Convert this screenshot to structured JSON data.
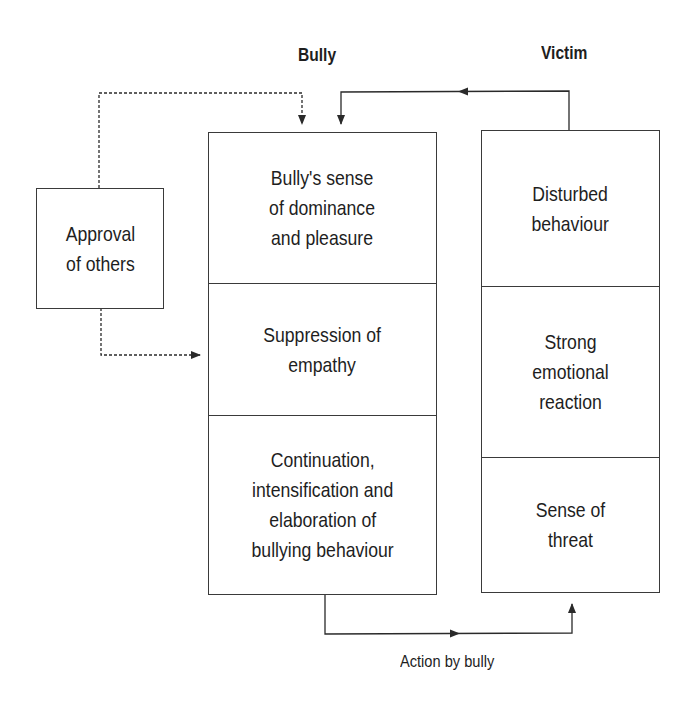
{
  "headings": {
    "bully": "Bully",
    "victim": "Victim"
  },
  "approval_box": {
    "label": "Approval\nof others"
  },
  "bully_column": {
    "cells": [
      {
        "label": "Bully's sense\nof dominance\nand pleasure"
      },
      {
        "label": "Suppression of\nempathy"
      },
      {
        "label": "Continuation,\nintensification and\nelaboration of\nbullying behaviour"
      }
    ]
  },
  "victim_column": {
    "cells": [
      {
        "label": "Disturbed\nbehaviour"
      },
      {
        "label": "Strong\nemotional\nreaction"
      },
      {
        "label": "Sense of\nthreat"
      }
    ]
  },
  "arrows": {
    "action_label": "Action by bully",
    "approval_to_dominance": "dashed",
    "approval_to_empathy": "dashed",
    "victim_to_bully": "solid",
    "bully_to_victim": "solid"
  },
  "colors": {
    "line": "#3a3a3a",
    "text": "#1e1e1e",
    "background": "#ffffff"
  }
}
